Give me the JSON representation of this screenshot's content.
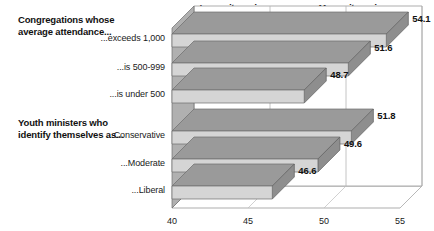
{
  "chart_data": {
    "type": "bar",
    "orientation": "horizontal",
    "style": "3d",
    "title": "",
    "subtitle": "",
    "xlabel": "",
    "ylabel": "",
    "xlim": [
      40,
      55
    ],
    "xticks": [
      40,
      45,
      50,
      55
    ],
    "xtick_labels": [
      "40",
      "45",
      "50",
      "55"
    ],
    "grid": true,
    "legend": false,
    "axis_headers": {
      "left": "Less witnessing",
      "right": "More witnessing"
    },
    "group_headings": [
      "Congregations whose\naverage attendance...",
      "Youth ministers who\nidentify themselves as..."
    ],
    "groups": [
      {
        "heading": "Congregations whose\naverage attendance...",
        "categories": [
          "...exceeds 1,000",
          "...is 500-999",
          "...is under 500"
        ],
        "values": [
          54.1,
          51.6,
          48.7
        ]
      },
      {
        "heading": "Youth ministers who\nidentify themselves as...",
        "categories": [
          "...Conservative",
          "...Moderate",
          "...Liberal"
        ],
        "values": [
          51.8,
          49.6,
          46.6
        ]
      }
    ],
    "categories": [
      "...exceeds 1,000",
      "...is 500-999",
      "...is under 500",
      "...Conservative",
      "...Moderate",
      "...Liberal"
    ],
    "values": [
      54.1,
      51.6,
      48.7,
      51.8,
      49.6,
      46.6
    ],
    "value_labels": [
      "54.1",
      "51.6",
      "48.7",
      "51.8",
      "49.6",
      "46.6"
    ],
    "colors": {
      "bar_face": "#d5d5d5",
      "bar_top": "#9a9a9a",
      "bar_end": "#8e8e8e",
      "wall": "#b0b0b0",
      "background": "#ffffff",
      "text": "#111111",
      "grid": "#b5b5b5"
    }
  }
}
